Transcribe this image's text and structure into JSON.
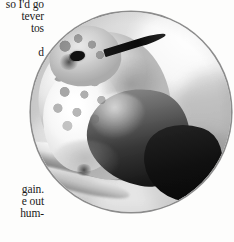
{
  "page": {
    "background_color": "#fdfdfc",
    "text_color": "#1a1a1a"
  },
  "body_text": {
    "top_block": [
      "so I'd go",
      "tever",
      "tos",
      "",
      "d"
    ],
    "bottom_block": [
      "gain.",
      "e out",
      "hum-"
    ]
  },
  "photo": {
    "caption": "",
    "subject": "hummingbird perched on a branch",
    "style": "black-and-white photograph",
    "shape": "circle",
    "border_color": "#8c8c8c",
    "diameter_px": 200
  }
}
